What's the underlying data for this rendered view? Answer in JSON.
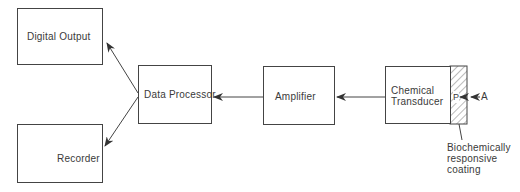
{
  "diagram": {
    "type": "block-diagram",
    "nodes": {
      "digital_output": "Digital Output",
      "recorder": "Recorder",
      "data_processor": "Data Processor",
      "amplifier": "Amplifier",
      "chemical_transducer_line1": "Chemical",
      "chemical_transducer_line2": "Transducer",
      "coating_label_line1": "Biochemically",
      "coating_label_line2": "responsive",
      "coating_label_line3": "coating",
      "product_marker": "P",
      "analyte_marker": "A"
    },
    "edges": [
      {
        "from": "Chemical Transducer",
        "to": "Amplifier"
      },
      {
        "from": "Amplifier",
        "to": "Data Processor"
      },
      {
        "from": "Data Processor",
        "to": "Digital Output"
      },
      {
        "from": "Data Processor",
        "to": "Recorder"
      },
      {
        "from": "A",
        "to": "P"
      }
    ],
    "colors": {
      "line": "#444444",
      "text": "#3a3a3a",
      "background": "#ffffff"
    }
  }
}
